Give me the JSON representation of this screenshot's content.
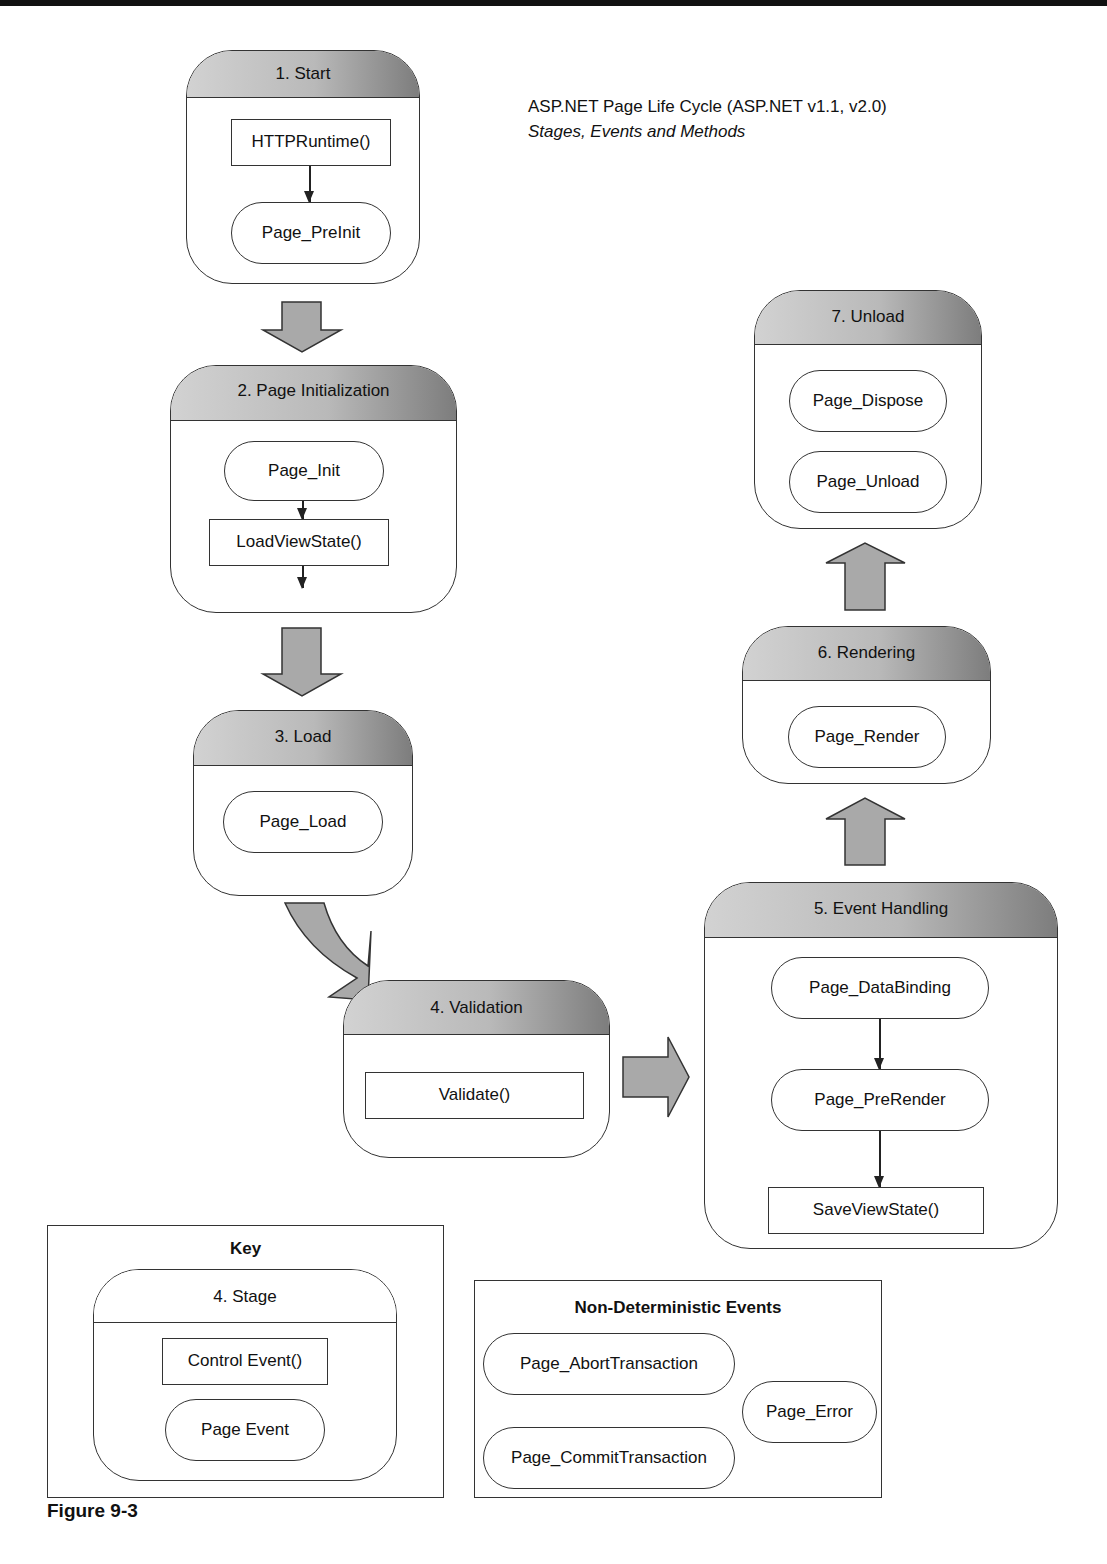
{
  "header": {
    "title": "ASP.NET Page Life Cycle (ASP.NET v1.1, v2.0)",
    "subtitle": "Stages, Events and Methods"
  },
  "stages": [
    {
      "label": "1. Start",
      "items": [
        {
          "type": "method",
          "label": "HTTPRuntime()"
        },
        {
          "type": "event",
          "label": "Page_PreInit"
        }
      ]
    },
    {
      "label": "2. Page Initialization",
      "items": [
        {
          "type": "event",
          "label": "Page_Init"
        },
        {
          "type": "method",
          "label": "LoadViewState()"
        }
      ]
    },
    {
      "label": "3. Load",
      "items": [
        {
          "type": "event",
          "label": "Page_Load"
        }
      ]
    },
    {
      "label": "4. Validation",
      "items": [
        {
          "type": "method",
          "label": "Validate()"
        }
      ]
    },
    {
      "label": "5. Event Handling",
      "items": [
        {
          "type": "event",
          "label": "Page_DataBinding"
        },
        {
          "type": "event",
          "label": "Page_PreRender"
        },
        {
          "type": "method",
          "label": "SaveViewState()"
        }
      ]
    },
    {
      "label": "6. Rendering",
      "items": [
        {
          "type": "event",
          "label": "Page_Render"
        }
      ]
    },
    {
      "label": "7. Unload",
      "items": [
        {
          "type": "event",
          "label": "Page_Dispose"
        },
        {
          "type": "event",
          "label": "Page_Unload"
        }
      ]
    }
  ],
  "key": {
    "title": "Key",
    "stage_label": "4. Stage",
    "method_label": "Control Event()",
    "event_label": "Page Event"
  },
  "non_deterministic": {
    "title": "Non-Deterministic Events",
    "events": [
      "Page_AbortTransaction",
      "Page_CommitTransaction",
      "Page_Error"
    ]
  },
  "caption": "Figure 9-3",
  "colors": {
    "stage_header_light": "#d2d2d2",
    "stage_header_dark": "#7d7d7d",
    "arrow_fill": "#a9a9a9",
    "stroke": "#333333"
  }
}
